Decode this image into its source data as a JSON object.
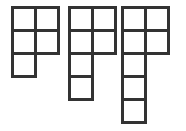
{
  "canvas": {
    "width": 186,
    "height": 131,
    "background_color": "#ffffff"
  },
  "figure": {
    "name": "polyomino-shape-set",
    "cell_size": 23,
    "stroke_color": "#333333",
    "stroke_width": 3,
    "cell_fill": "#ffffff"
  },
  "shapes": [
    {
      "id": "shape-1",
      "label": "P-pentomino",
      "origin_x": 12,
      "origin_y": 7,
      "rows": 3,
      "cols": 2,
      "cell_count": 5,
      "cells": [
        {
          "col": 0,
          "row": 0
        },
        {
          "col": 1,
          "row": 0
        },
        {
          "col": 0,
          "row": 1
        },
        {
          "col": 1,
          "row": 1
        },
        {
          "col": 0,
          "row": 2
        }
      ]
    },
    {
      "id": "shape-2",
      "label": "L-hexomino",
      "origin_x": 69,
      "origin_y": 7,
      "rows": 4,
      "cols": 2,
      "cell_count": 6,
      "cells": [
        {
          "col": 0,
          "row": 0
        },
        {
          "col": 1,
          "row": 0
        },
        {
          "col": 0,
          "row": 1
        },
        {
          "col": 1,
          "row": 1
        },
        {
          "col": 0,
          "row": 2
        },
        {
          "col": 0,
          "row": 3
        }
      ]
    },
    {
      "id": "shape-3",
      "label": "L-heptomino",
      "origin_x": 122,
      "origin_y": 7,
      "rows": 5,
      "cols": 2,
      "cell_count": 7,
      "cells": [
        {
          "col": 0,
          "row": 0
        },
        {
          "col": 1,
          "row": 0
        },
        {
          "col": 0,
          "row": 1
        },
        {
          "col": 1,
          "row": 1
        },
        {
          "col": 0,
          "row": 2
        },
        {
          "col": 0,
          "row": 3
        },
        {
          "col": 0,
          "row": 4
        }
      ]
    }
  ]
}
